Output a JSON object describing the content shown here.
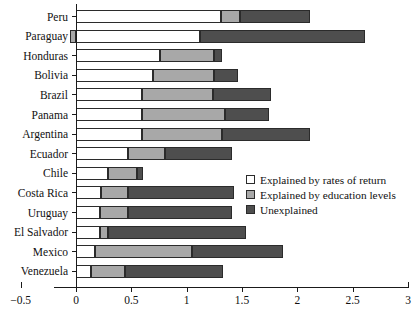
{
  "chart_data": {
    "type": "bar",
    "orientation": "horizontal",
    "stacked": true,
    "title": "",
    "xlabel": "",
    "ylabel": "",
    "xlim": [
      -0.5,
      3
    ],
    "xticks": [
      -0.5,
      0,
      0.5,
      1,
      1.5,
      2,
      2.5,
      3
    ],
    "xticklabels": [
      "−0.5",
      "0",
      "0.5",
      "1",
      "1.5",
      "2",
      "2.5",
      "3"
    ],
    "grid": false,
    "legend_position": "middle-right",
    "categories": [
      "Peru",
      "Paraguay",
      "Honduras",
      "Bolivia",
      "Brazil",
      "Panama",
      "Argentina",
      "Ecuador",
      "Chile",
      "Costa Rica",
      "Uruguay",
      "El Salvador",
      "Mexico",
      "Venezuela"
    ],
    "series": [
      {
        "name": "Explained by rates of return",
        "color": "#ffffff",
        "values": [
          1.31,
          1.12,
          0.76,
          0.7,
          0.6,
          0.6,
          0.6,
          0.47,
          0.29,
          0.23,
          0.22,
          0.22,
          0.17,
          0.14
        ]
      },
      {
        "name": "Explained by education levels",
        "color": "#a8a8a8",
        "values": [
          0.17,
          -0.05,
          0.49,
          0.55,
          0.64,
          0.75,
          0.72,
          0.33,
          0.26,
          0.24,
          0.25,
          0.07,
          0.88,
          0.3
        ]
      },
      {
        "name": "Unexplained",
        "color": "#4e4e4e",
        "values": [
          0.63,
          1.49,
          0.07,
          0.21,
          0.52,
          0.39,
          0.79,
          0.61,
          0.06,
          0.96,
          0.94,
          1.25,
          0.82,
          0.89
        ]
      }
    ],
    "totals": [
      2.11,
      2.61,
      1.32,
      1.46,
      1.76,
      1.74,
      2.11,
      1.41,
      0.61,
      1.43,
      1.41,
      1.54,
      1.87,
      1.33
    ]
  },
  "legend": {
    "items": [
      {
        "label": "Explained by rates of return",
        "color": "#ffffff"
      },
      {
        "label": "Explained by education levels",
        "color": "#a8a8a8"
      },
      {
        "label": "Unexplained",
        "color": "#4e4e4e"
      }
    ]
  }
}
